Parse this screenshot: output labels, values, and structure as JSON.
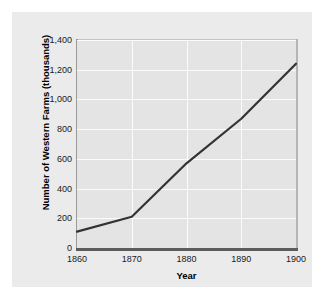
{
  "chart_data": {
    "type": "line",
    "title": "",
    "xlabel": "Year",
    "ylabel": "Number of Western Farms (thousands)",
    "x": [
      1860,
      1870,
      1880,
      1890,
      1900
    ],
    "values": [
      110,
      210,
      570,
      870,
      1240
    ],
    "series": [
      {
        "name": "Number of Western Farms",
        "values": [
          110,
          210,
          570,
          870,
          1240
        ]
      }
    ],
    "xlim": [
      1860,
      1900
    ],
    "ylim": [
      0,
      1400
    ],
    "x_ticks": [
      1860,
      1870,
      1880,
      1890,
      1900
    ],
    "x_tick_labels": [
      "1860",
      "1870",
      "1880",
      "1890",
      "1900"
    ],
    "y_ticks": [
      0,
      200,
      400,
      600,
      800,
      1000,
      1200,
      1400
    ],
    "y_tick_labels": [
      "0",
      "200",
      "400",
      "600",
      "800",
      "1,000",
      "1,200",
      "1,400"
    ],
    "grid": true,
    "legend": false,
    "legend_position": "none",
    "line_color": "#333333",
    "grid_color": "#fbfbfb",
    "plot_background": "#e4e4e4",
    "figure_background": "#ebebeb",
    "axis_color": "#5c5c5c"
  }
}
